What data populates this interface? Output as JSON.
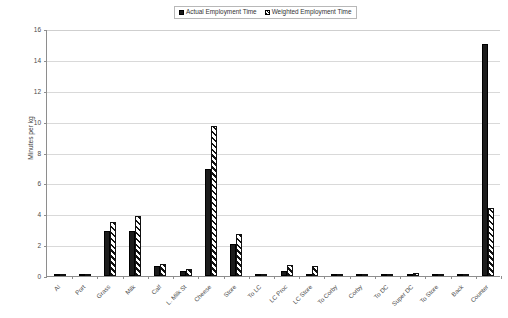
{
  "chart_data": {
    "type": "bar",
    "title": "",
    "xlabel": "",
    "ylabel": "Minutes per kg",
    "ylim": [
      0,
      16
    ],
    "ytick_step": 2,
    "yticks": [
      "0",
      "2",
      "4",
      "6",
      "8",
      "10",
      "12",
      "14",
      "16"
    ],
    "grid": true,
    "legend_position": "top-center",
    "categories": [
      "AI",
      "Port",
      "Grass",
      "Milk",
      "Calf",
      "L. Milk St",
      "Cheese",
      "Store",
      "To LC",
      "LC Proc",
      "LC Store",
      "To Corby",
      "Corby",
      "To DC",
      "Super DC",
      "To Store",
      "Back",
      "Counter"
    ],
    "series": [
      {
        "name": "Actual Employment Time",
        "style": "solid-black",
        "values": [
          0.02,
          0.1,
          2.9,
          2.9,
          0.65,
          0.3,
          6.9,
          2.1,
          0.02,
          0.35,
          0.1,
          0.02,
          0.02,
          0.02,
          0.15,
          0.02,
          0.02,
          15.0
        ]
      },
      {
        "name": "Weighted Employment Time",
        "style": "diagonal-hatch",
        "values": [
          0.03,
          0.15,
          3.5,
          3.9,
          0.8,
          0.45,
          9.7,
          2.7,
          0.03,
          0.7,
          0.65,
          0.03,
          0.03,
          0.03,
          0.2,
          0.03,
          0.03,
          4.4
        ]
      }
    ]
  },
  "legend": {
    "entries": [
      {
        "label": "Actual Employment Time"
      },
      {
        "label": "Weighted Employment Time"
      }
    ]
  },
  "axis": {
    "y_title": "Minutes per kg"
  },
  "colors": {
    "series_1": "#1c1c1c",
    "series_2": "#ffffff",
    "grid": "#d9d9d9",
    "axis": "#8e8e8e",
    "background": "#ffffff"
  }
}
